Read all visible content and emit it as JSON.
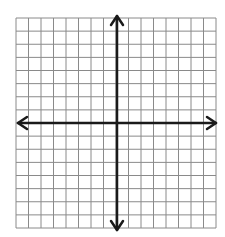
{
  "diagram": {
    "type": "coordinate-grid",
    "grid": {
      "columns": 16,
      "rows": 16,
      "line_color": "#8a8a8a"
    },
    "axes": {
      "color": "#1a1a1a",
      "x_axis_arrows": "both",
      "y_axis_arrows": "both"
    },
    "labels": []
  }
}
